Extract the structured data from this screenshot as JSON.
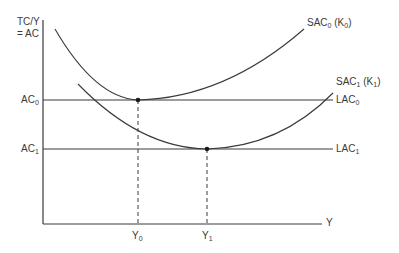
{
  "diagram": {
    "y_axis_label_line1": "TC/Y",
    "y_axis_label_line2": "= AC",
    "x_axis_label": "Y",
    "labels": {
      "ac0": {
        "base": "AC",
        "sub": "0"
      },
      "ac1": {
        "base": "AC",
        "sub": "1"
      },
      "y0": {
        "base": "Y",
        "sub": "0"
      },
      "y1": {
        "base": "Y",
        "sub": "1"
      },
      "sac0": {
        "base": "SAC",
        "sub": "0",
        "paren_base": "(K",
        "paren_sub": "0",
        "paren_close": ")"
      },
      "sac1": {
        "base": "SAC",
        "sub": "1",
        "paren_base": "(K",
        "paren_sub": "1",
        "paren_close": ")"
      },
      "lac0": {
        "base": "LAC",
        "sub": "0"
      },
      "lac1": {
        "base": "LAC",
        "sub": "1"
      }
    },
    "colors": {
      "line": "#3a3a3a",
      "background": "#ffffff"
    },
    "points": [
      {
        "name": "SAC0 minimum",
        "x_label": "Y0",
        "y_label": "AC0"
      },
      {
        "name": "SAC1 minimum",
        "x_label": "Y1",
        "y_label": "AC1"
      }
    ]
  }
}
